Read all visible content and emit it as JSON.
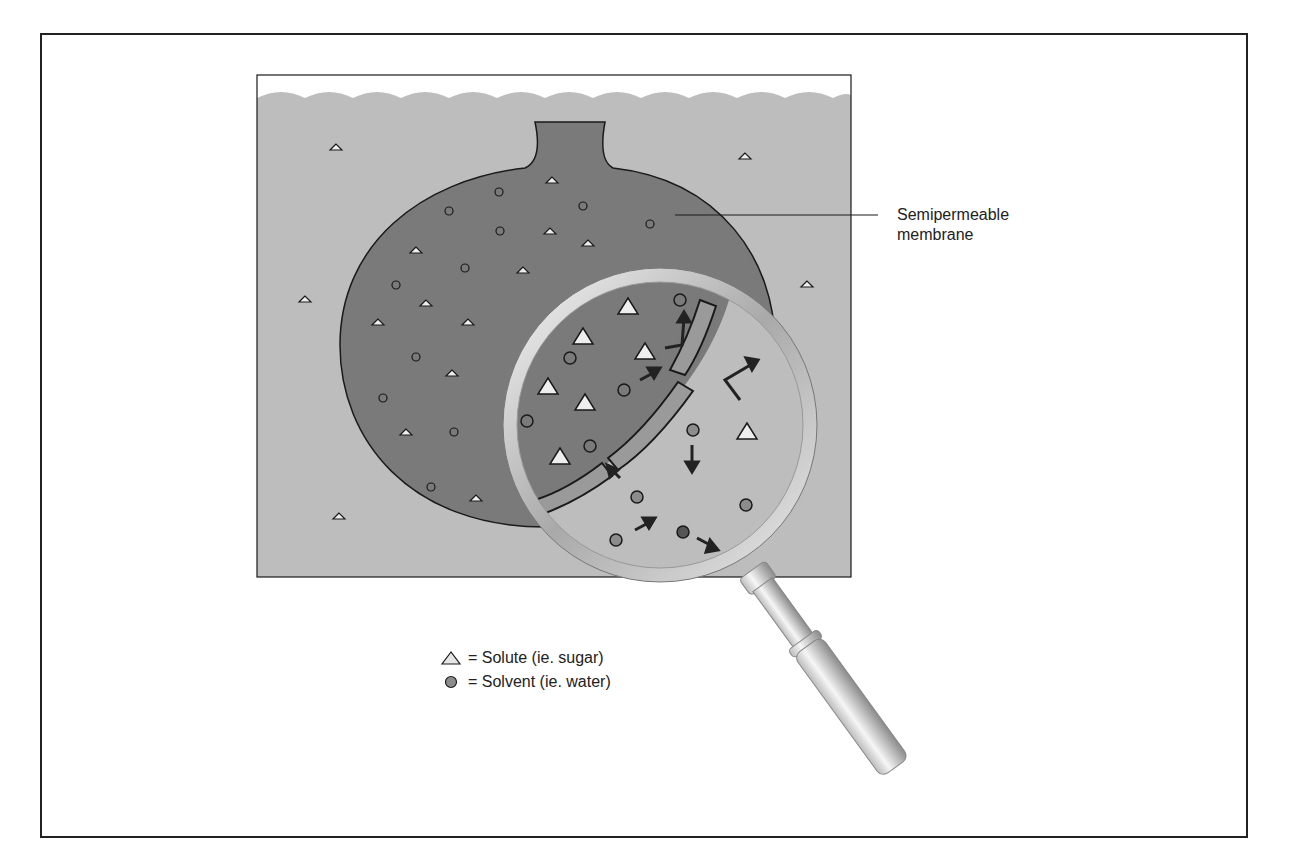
{
  "diagram": {
    "labels": {
      "membrane_line1": "Semipermeable",
      "membrane_line2": "membrane"
    },
    "legend": [
      {
        "symbol": "triangle-icon",
        "text": "= Solute (ie. sugar)"
      },
      {
        "symbol": "circle-icon",
        "text": "= Solvent (ie. water)"
      }
    ],
    "colors": {
      "outer_solution": "#bdbdbd",
      "inner_solution": "#7a7a7a",
      "solvent": "#8c8c8c",
      "solute": "#e6e6e6",
      "outline": "#1a1a1a"
    }
  }
}
